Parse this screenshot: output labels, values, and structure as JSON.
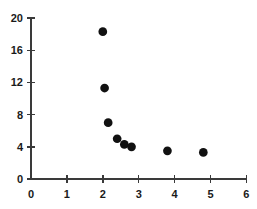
{
  "chart_data": {
    "type": "scatter",
    "title": "",
    "subtitle": "",
    "xlabel": "",
    "ylabel": "",
    "xlim": [
      0,
      6
    ],
    "ylim": [
      0,
      20
    ],
    "xticks": [
      0,
      1,
      2,
      3,
      4,
      5,
      6
    ],
    "yticks": [
      0,
      4,
      8,
      12,
      16,
      20
    ],
    "xtick_labels": [
      "0",
      "1",
      "2",
      "3",
      "4",
      "5",
      "6"
    ],
    "ytick_labels": [
      "0",
      "4",
      "8",
      "12",
      "16",
      "20"
    ],
    "grid": false,
    "legend": null,
    "legend_position": "none",
    "marker": "filled-circle",
    "marker_color": "#111111",
    "marker_size": 5,
    "annotations": [],
    "series": [
      {
        "name": "series-1",
        "points": [
          {
            "x": 2.0,
            "y": 18.3
          },
          {
            "x": 2.05,
            "y": 11.3
          },
          {
            "x": 2.15,
            "y": 7.0
          },
          {
            "x": 2.4,
            "y": 5.0
          },
          {
            "x": 2.6,
            "y": 4.3
          },
          {
            "x": 2.8,
            "y": 4.0
          },
          {
            "x": 3.8,
            "y": 3.5
          },
          {
            "x": 4.8,
            "y": 3.3
          }
        ]
      }
    ]
  }
}
